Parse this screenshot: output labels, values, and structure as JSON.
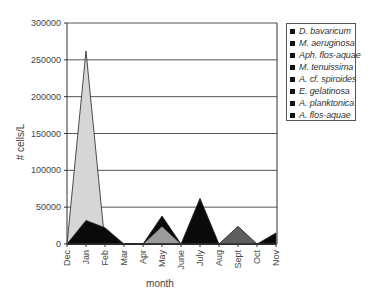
{
  "chart_data": {
    "type": "area",
    "title": "",
    "xlabel": "month",
    "ylabel": "# cells/L",
    "ylim": [
      0,
      300000
    ],
    "yticks": [
      0,
      50000,
      100000,
      150000,
      200000,
      250000,
      300000
    ],
    "grid": true,
    "legend_position": "right",
    "categories": [
      "Dec",
      "Jan",
      "Feb",
      "Mar",
      "Apr",
      "May",
      "June",
      "July",
      "Aug",
      "Sept",
      "Oct",
      "Nov"
    ],
    "legend": [
      "D. bavaricum",
      "M. aeruginosa",
      "Aph. flos-aquae",
      "M. tenuissima",
      "A. cf. spiroides",
      "E. gelatinosa",
      "A. planktonica",
      "A. flos-aquae"
    ],
    "series": [
      {
        "name": "light-grey layer",
        "color": "#d6d6d6",
        "values": [
          0,
          262000,
          0,
          0,
          0,
          0,
          0,
          0,
          0,
          0,
          0,
          0
        ]
      },
      {
        "name": "black layer",
        "color": "#0a0a0a",
        "values": [
          0,
          32000,
          22000,
          0,
          0,
          38000,
          0,
          62000,
          0,
          0,
          0,
          15000
        ]
      },
      {
        "name": "medium-grey layer",
        "color": "#9c9c9c",
        "values": [
          0,
          0,
          0,
          0,
          0,
          24000,
          0,
          0,
          0,
          0,
          0,
          0
        ]
      },
      {
        "name": "dark-grey layer",
        "color": "#5e5e5e",
        "values": [
          0,
          0,
          0,
          0,
          0,
          0,
          0,
          0,
          0,
          24000,
          0,
          0
        ]
      }
    ]
  },
  "legend": {
    "items": [
      {
        "label": "D. bavaricum"
      },
      {
        "label": "M. aeruginosa"
      },
      {
        "label": "Aph. flos-aquae"
      },
      {
        "label": "M. tenuissima"
      },
      {
        "label": "A. cf. spiroides"
      },
      {
        "label": "E. gelatinosa"
      },
      {
        "label": "A. planktonica"
      },
      {
        "label": "A. flos-aquae"
      }
    ]
  },
  "axes": {
    "x_title": "month",
    "y_title": "# cells/L",
    "y_tick_labels": [
      "0",
      "50000",
      "100000",
      "150000",
      "200000",
      "250000",
      "300000"
    ],
    "x_tick_labels": [
      "Dec",
      "Jan",
      "Feb",
      "Mar",
      "Apr",
      "May",
      "June",
      "July",
      "Aug",
      "Sept",
      "Oct",
      "Nov"
    ]
  }
}
